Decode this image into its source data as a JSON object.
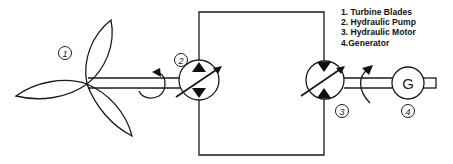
{
  "diagram": {
    "components": [
      {
        "id": "1",
        "name": "Turbine Blades"
      },
      {
        "id": "2",
        "name": "Hydraulic Pump"
      },
      {
        "id": "3",
        "name": "Hydraulic Motor"
      },
      {
        "id": "4",
        "name": "Generator"
      }
    ],
    "labels": {
      "c1": "1",
      "c2": "2",
      "c3": "3",
      "c4": "4"
    },
    "generator_symbol": "G",
    "legend": [
      "1. Turbine Blades",
      "2. Hydraulic Pump",
      "3. Hydraulic Motor",
      "4.Generator"
    ],
    "colors": {
      "line": "#1a1a1a",
      "background": "#ffffff"
    }
  }
}
